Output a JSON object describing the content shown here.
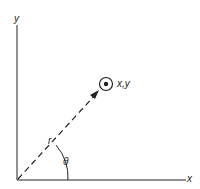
{
  "diagram": {
    "axes": {
      "x_label": "x",
      "y_label": "y"
    },
    "point_label": "x,y",
    "radius_label": "r",
    "angle_label": "θ",
    "colors": {
      "ink": "#222222",
      "background": "#ffffff"
    }
  }
}
